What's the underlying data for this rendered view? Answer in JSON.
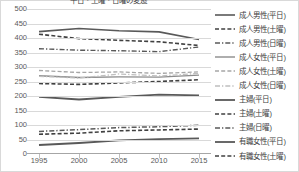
{
  "chart_data": {
    "type": "line",
    "title": "平日・土曜・日曜の変遷",
    "xlabel": "",
    "ylabel": "",
    "x": [
      1995,
      2000,
      2005,
      2010,
      2015
    ],
    "xlim": [
      1993.5,
      2016.5
    ],
    "ylim": [
      0,
      500
    ],
    "ytick_step": 50,
    "grid": true,
    "legend_position": "right",
    "xticklabels": [
      "1995",
      "2000",
      "2005",
      "2010",
      "2015"
    ],
    "yticklabels": [
      "500",
      "450",
      "400",
      "350",
      "300",
      "250",
      "200",
      "150",
      "100",
      "50",
      "0"
    ],
    "series": [
      {
        "name": "成人男性(平日)",
        "style": "solid",
        "color": "#595959",
        "width": 1.6,
        "values": [
          422,
          433,
          425,
          421,
          395
        ]
      },
      {
        "name": "成人男性(土曜)",
        "style": "dashed",
        "color": "#404040",
        "width": 1.6,
        "values": [
          413,
          398,
          392,
          387,
          374
        ]
      },
      {
        "name": "成人男性(日曜)",
        "style": "dashdot",
        "color": "#595959",
        "width": 1.4,
        "values": [
          363,
          358,
          356,
          353,
          369
        ]
      },
      {
        "name": "成人女性(平日)",
        "style": "solid",
        "color": "#8c8c8c",
        "width": 1.4,
        "values": [
          270,
          264,
          266,
          265,
          272
        ]
      },
      {
        "name": "成人女性(土曜)",
        "style": "dashed",
        "color": "#a6a6a6",
        "width": 1.3,
        "values": [
          288,
          281,
          283,
          278,
          283
        ]
      },
      {
        "name": "成人女性(日曜)",
        "style": "dashdot",
        "color": "#bfbfbf",
        "width": 1.3,
        "values": [
          268,
          262,
          276,
          269,
          278
        ]
      },
      {
        "name": "主婦(平日)",
        "style": "solid",
        "color": "#595959",
        "width": 1.8,
        "values": [
          197,
          188,
          197,
          205,
          202
        ]
      },
      {
        "name": "主婦(土曜)",
        "style": "dashed",
        "color": "#404040",
        "width": 1.6,
        "values": [
          243,
          240,
          245,
          250,
          256
        ]
      },
      {
        "name": "主婦(日曜)",
        "style": "dashdot",
        "color": "#595959",
        "width": 1.5,
        "values": [
          78,
          84,
          91,
          94,
          99
        ]
      },
      {
        "name": "有職女性(平日)",
        "style": "solid",
        "color": "#595959",
        "width": 1.8,
        "values": [
          31,
          38,
          47,
          51,
          54
        ]
      },
      {
        "name": "有職女性(土曜)",
        "style": "dashed",
        "color": "#404040",
        "width": 1.6,
        "values": [
          68,
          72,
          80,
          83,
          86
        ]
      }
    ]
  },
  "colors": {
    "grid": "#d9d9d9",
    "axis": "#a6a6a6",
    "tick_text": "#595959",
    "legend_text": "#404040",
    "border": "#d9d9d9",
    "background": "#ffffff"
  }
}
